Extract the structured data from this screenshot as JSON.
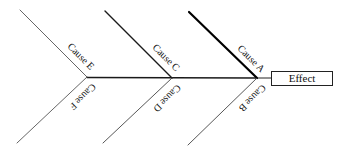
{
  "diagram": {
    "type": "fishbone",
    "effect": {
      "label": "Effect",
      "box": {
        "x": 271,
        "y": 71,
        "width": 61,
        "height": 14
      }
    },
    "spine": {
      "x1": 87,
      "y1": 77.5,
      "x2": 257,
      "y2": 78,
      "stroke_width": 1.5,
      "color": "#1a1a1a"
    },
    "connector": {
      "x1": 257,
      "y1": 78,
      "x2": 271,
      "y2": 78
    },
    "causes": [
      {
        "id": "A",
        "label": "Cause A",
        "position": "top",
        "x1": 189,
        "y1": 12,
        "x2": 257,
        "y2": 78,
        "stroke_width": 2.2,
        "color": "#000000"
      },
      {
        "id": "B",
        "label": "Cause B",
        "position": "bottom",
        "x1": 257,
        "y1": 78,
        "x2": 188,
        "y2": 145,
        "stroke_width": 0.9,
        "color": "#444444"
      },
      {
        "id": "C",
        "label": "Cause C",
        "position": "top",
        "x1": 105,
        "y1": 11,
        "x2": 172,
        "y2": 78,
        "stroke_width": 1.4,
        "color": "#1a1a1a"
      },
      {
        "id": "D",
        "label": "Cause D",
        "position": "bottom",
        "x1": 172,
        "y1": 78,
        "x2": 103,
        "y2": 143,
        "stroke_width": 0.9,
        "color": "#444444"
      },
      {
        "id": "E",
        "label": "Cause E",
        "position": "top",
        "x1": 20,
        "y1": 10,
        "x2": 87,
        "y2": 77,
        "stroke_width": 0.9,
        "color": "#555555"
      },
      {
        "id": "F",
        "label": "Cause F",
        "position": "bottom",
        "x1": 87,
        "y1": 77,
        "x2": 17,
        "y2": 143,
        "stroke_width": 0.9,
        "color": "#555555"
      }
    ]
  }
}
